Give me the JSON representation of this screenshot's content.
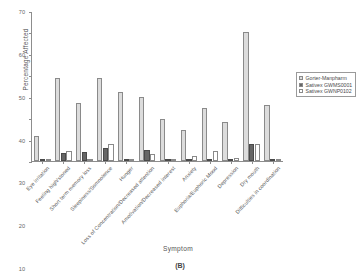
{
  "chart_data": {
    "type": "bar",
    "title": "",
    "caption": "(B)",
    "xlabel": "Symptom",
    "ylabel": "Percentage Affected",
    "ylim": [
      0,
      70
    ],
    "yticks": [
      0,
      10,
      20,
      30,
      40,
      50,
      60,
      70
    ],
    "grid": false,
    "legend_position": "right",
    "categories": [
      "Eye irritation",
      "Feeling high/stoned",
      "Short term memory loss",
      "Sleepiness/Somnolence",
      "Hunger",
      "Loss of Concentration/Decreased attention",
      "Amotivation/Decreased interest",
      "Anxiety",
      "Euphoria/Euphoric Mood",
      "Depression",
      "Dry mouth",
      "Difficulties in coordination"
    ],
    "series": [
      {
        "name": "Gorter-Manpharm",
        "color": "#dcdcdc",
        "values": [
          11.8,
          38.7,
          27.1,
          38.8,
          32.1,
          30.0,
          19.6,
          14.3,
          24.7,
          18.4,
          60.0,
          26.0
        ]
      },
      {
        "name": "Sativex GWMS0001",
        "color": "#666666",
        "values": [
          0.3,
          3.6,
          4.4,
          6.0,
          0.8,
          5.3,
          0.7,
          0.8,
          0.3,
          0.8,
          7.8,
          0.8
        ]
      },
      {
        "name": "Sativex GWNP0102",
        "color": "#ffffff",
        "values": [
          0.2,
          4.8,
          1.1,
          8.0,
          1.0,
          3.4,
          0.5,
          2.2,
          4.6,
          1.6,
          8.0,
          0.5
        ]
      }
    ]
  }
}
